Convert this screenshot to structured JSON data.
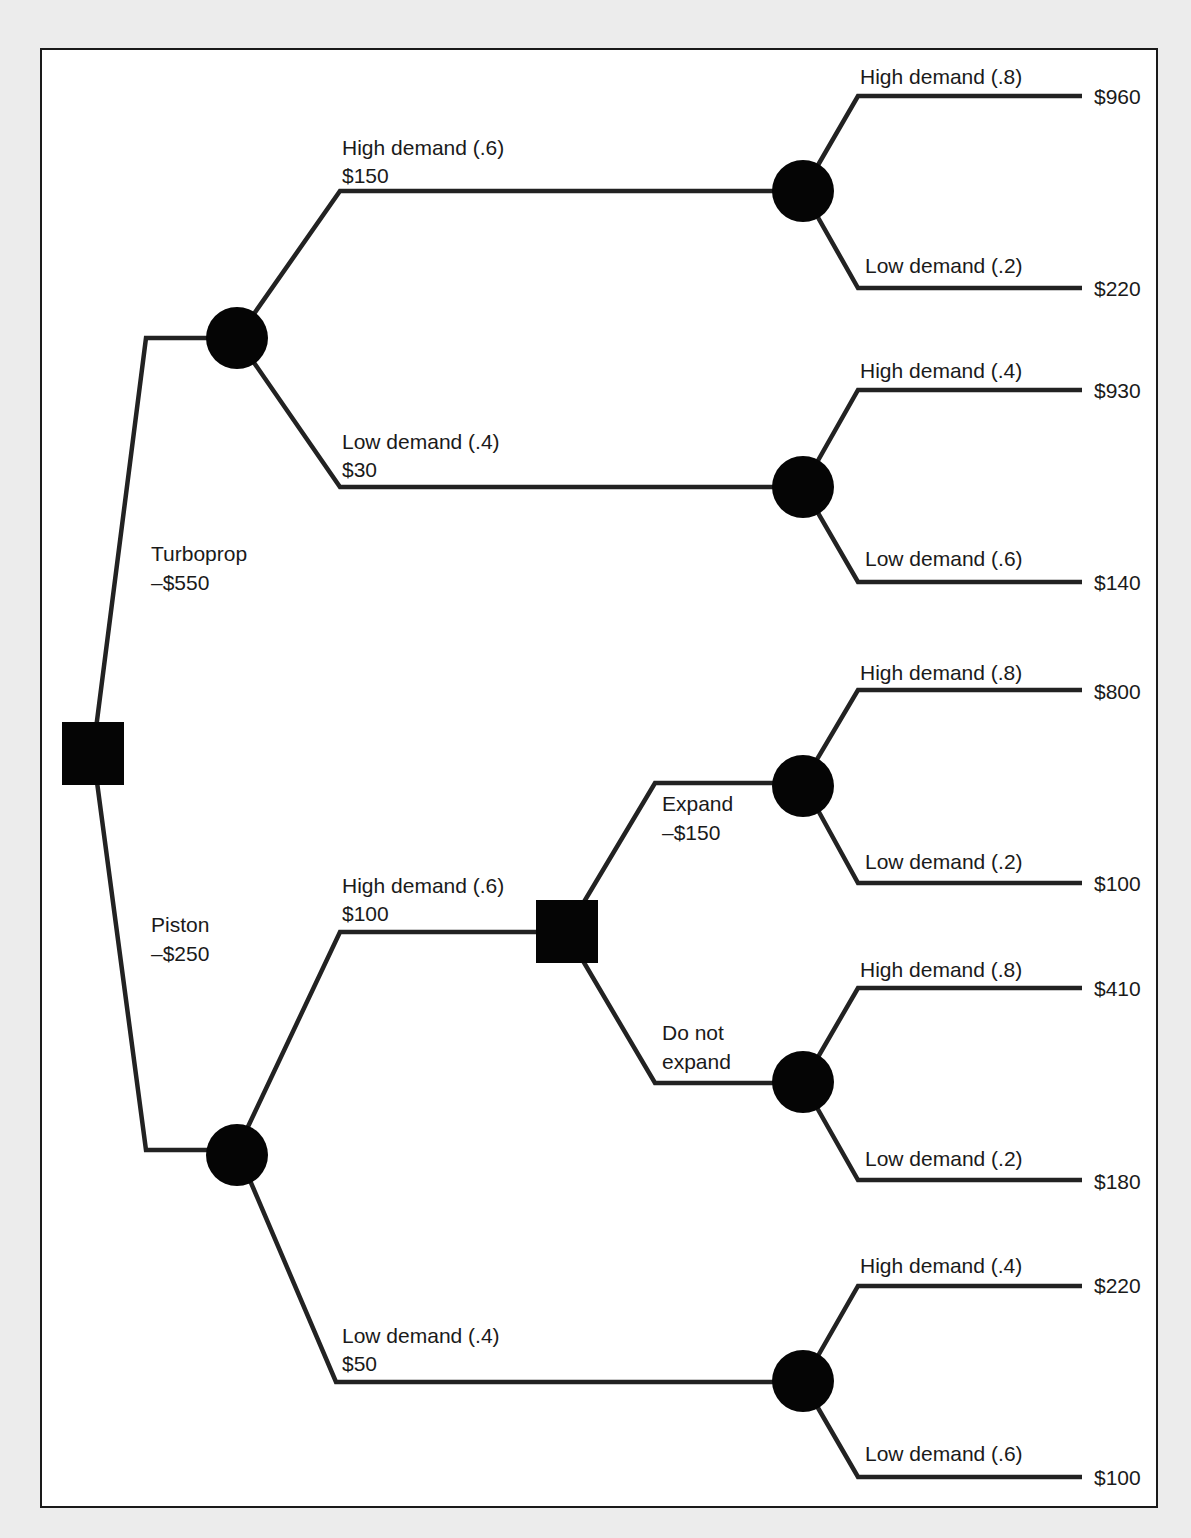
{
  "diagram": {
    "type": "decision-tree",
    "root": {
      "kind": "decision",
      "branches": [
        {
          "label": "Turboprop",
          "cost": "–$550",
          "node": {
            "kind": "chance",
            "branches": [
              {
                "label": "High demand (.6)",
                "value": "$150",
                "node": {
                  "kind": "chance",
                  "branches": [
                    {
                      "label": "High demand (.8)",
                      "payoff": "$960"
                    },
                    {
                      "label": "Low demand (.2)",
                      "payoff": "$220"
                    }
                  ]
                }
              },
              {
                "label": "Low demand (.4)",
                "value": "$30",
                "node": {
                  "kind": "chance",
                  "branches": [
                    {
                      "label": "High demand (.4)",
                      "payoff": "$930"
                    },
                    {
                      "label": "Low demand (.6)",
                      "payoff": "$140"
                    }
                  ]
                }
              }
            ]
          }
        },
        {
          "label": "Piston",
          "cost": "–$250",
          "node": {
            "kind": "chance",
            "branches": [
              {
                "label": "High demand (.6)",
                "value": "$100",
                "node": {
                  "kind": "decision",
                  "branches": [
                    {
                      "label": "Expand",
                      "cost": "–$150",
                      "node": {
                        "kind": "chance",
                        "branches": [
                          {
                            "label": "High demand (.8)",
                            "payoff": "$800"
                          },
                          {
                            "label": "Low demand (.2)",
                            "payoff": "$100"
                          }
                        ]
                      }
                    },
                    {
                      "label_line1": "Do not",
                      "label_line2": "expand",
                      "node": {
                        "kind": "chance",
                        "branches": [
                          {
                            "label": "High demand (.8)",
                            "payoff": "$410"
                          },
                          {
                            "label": "Low demand (.2)",
                            "payoff": "$180"
                          }
                        ]
                      }
                    }
                  ]
                }
              },
              {
                "label": "Low demand (.4)",
                "value": "$50",
                "node": {
                  "kind": "chance",
                  "branches": [
                    {
                      "label": "High demand (.4)",
                      "payoff": "$220"
                    },
                    {
                      "label": "Low demand (.6)",
                      "payoff": "$100"
                    }
                  ]
                }
              }
            ]
          }
        }
      ]
    }
  },
  "colors": {
    "page_background": "#ececec",
    "panel_background": "#ffffff",
    "ink": "#1a1a1a"
  }
}
